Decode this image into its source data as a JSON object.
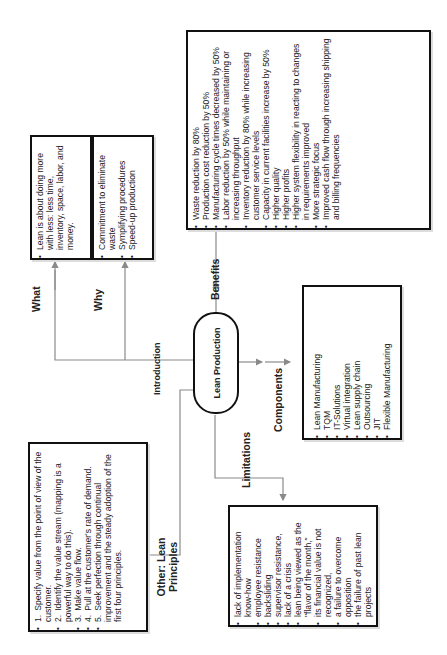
{
  "diagram": {
    "center_node": "Lean Production",
    "branches": {
      "introduction": {
        "label": "Introduction",
        "what": {
          "label": "What",
          "items": [
            "Lean is about doing more with less: less time, inventory, space, labor, and money."
          ]
        },
        "why": {
          "label": "Why",
          "items": [
            "Commitment to eliminate waste",
            "Symplifying procedures",
            "Speed-up production"
          ]
        }
      },
      "benefits": {
        "label": "Benefits",
        "items": [
          "Waste reduction by 80%",
          "Production cost reduction by 50%",
          "Manufacturing cycle times decreased by 50%",
          "Labor reduction by 50% while maintaining or increasing throughput",
          "Inventory reduction by 80% while increasing customer service levels",
          "Capacity in current facilities increase by 50%",
          "Higher quality",
          "Higher profits",
          "Higher system flexibility in reacting to changes in requirements improved",
          "More strategic focus",
          "Improved cash flow through increasing shipping and billing frequencies"
        ]
      },
      "components": {
        "label": "Components",
        "items": [
          "Lean Manufacturing",
          "TQM",
          "IT-Solutions",
          "Virtual integration",
          "Lean supply chain",
          "Outsourcing",
          "JIT",
          "Flexible Manufacturing"
        ]
      },
      "limitations": {
        "label": "Limitations",
        "items": [
          "lack of implementation know-how",
          "employee resistance",
          "backsliding",
          "supervisor resistance,",
          "lack of a crisis",
          "lean being viewed as the \"flavor of the month,\"",
          "its financial value is not recognized,",
          "a failure to overcome opposition",
          "the failure of past lean projects"
        ]
      },
      "principles": {
        "label": "Other: Lean Principles",
        "items": [
          {
            "num": "1.",
            "text": "Specify value from the point of view of the customer."
          },
          {
            "num": "2.",
            "text": "Identify the value stream (mapping is a powerful way to do this)."
          },
          {
            "num": "3.",
            "text": "Make value flow."
          },
          {
            "num": "4.",
            "text": "Pull at the customer's rate of demand."
          },
          {
            "num": "5.",
            "text": "Seek perfection through continual improvement and the steady adoption of the first four principles."
          }
        ]
      }
    },
    "colors": {
      "box_border": "#111111",
      "connector": "#888888",
      "text": "#222222"
    }
  }
}
